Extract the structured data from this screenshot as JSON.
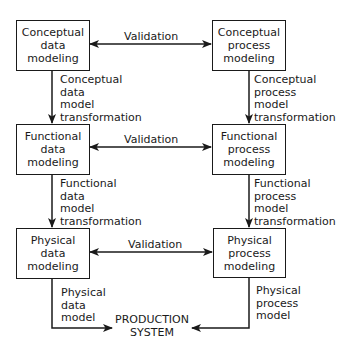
{
  "diagram": {
    "boxes": [
      {
        "id": "conceptual-data",
        "lines": [
          "Conceptual",
          "data",
          "modeling"
        ]
      },
      {
        "id": "conceptual-process",
        "lines": [
          "Conceptual",
          "process",
          "modeling"
        ]
      },
      {
        "id": "functional-data",
        "lines": [
          "Functional",
          "data",
          "modeling"
        ]
      },
      {
        "id": "functional-process",
        "lines": [
          "Functional",
          "process",
          "modeling"
        ]
      },
      {
        "id": "physical-data",
        "lines": [
          "Physical",
          "data",
          "modeling"
        ]
      },
      {
        "id": "physical-process",
        "lines": [
          "Physical",
          "process",
          "modeling"
        ]
      }
    ],
    "validation_labels": [
      "Validation",
      "Validation",
      "Validation"
    ],
    "transitions": {
      "conceptual_data": [
        "Conceptual",
        "data",
        "model",
        "transformation"
      ],
      "conceptual_process": [
        "Conceptual",
        "process",
        "model",
        "transformation"
      ],
      "functional_data": [
        "Functional",
        "data",
        "model",
        "transformation"
      ],
      "functional_process": [
        "Functional",
        "process",
        "model",
        "transformation"
      ],
      "physical_data": [
        "Physical",
        "data",
        "model"
      ],
      "physical_process": [
        "Physical",
        "process",
        "model"
      ]
    },
    "production_system": [
      "PRODUCTION",
      "SYSTEM"
    ],
    "colors": {
      "stroke": "#1a1a1a",
      "background": "#ffffff"
    }
  }
}
